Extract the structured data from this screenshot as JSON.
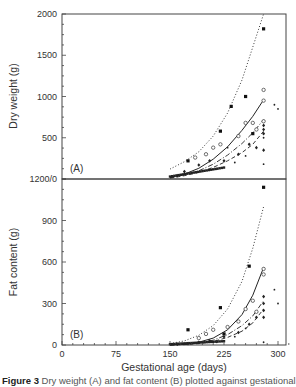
{
  "figure": {
    "caption_label": "Figure 3",
    "caption_text": "Dry weight (A) and fat content (B) plotted against gestational age"
  },
  "chart_data": [
    {
      "type": "scatter",
      "panel_label": "(A)",
      "title": "",
      "xlabel": "Gestational age (days)",
      "ylabel": "Dry weight (g)",
      "xlim": [
        0,
        320
      ],
      "ylim": [
        0,
        2000
      ],
      "xticks": [
        0,
        75,
        150,
        225,
        300
      ],
      "yticks": [
        0,
        500,
        1000,
        1500,
        2000
      ],
      "ytick_labels": [
        "1200/0",
        "500",
        "1000",
        "1500",
        "2000"
      ],
      "grid": false,
      "series": [
        {
          "name": "filled squares",
          "marker": "square-filled",
          "x": [
            175,
            220,
            235,
            255,
            265,
            280
          ],
          "y": [
            220,
            580,
            880,
            1000,
            550,
            1820
          ]
        },
        {
          "name": "open circles",
          "marker": "circle-open",
          "x": [
            185,
            200,
            210,
            220,
            245,
            255,
            265,
            270,
            280,
            280,
            280
          ],
          "y": [
            260,
            300,
            380,
            420,
            520,
            680,
            680,
            600,
            950,
            1080,
            700
          ]
        },
        {
          "name": "filled diamonds",
          "marker": "diamond-filled",
          "x": [
            160,
            170,
            190,
            205,
            225,
            245,
            260,
            270,
            280,
            280,
            280,
            280
          ],
          "y": [
            40,
            90,
            170,
            220,
            220,
            300,
            420,
            380,
            550,
            600,
            650,
            350
          ]
        },
        {
          "name": "small dots",
          "marker": "dot",
          "x": [
            215,
            230,
            240,
            255,
            280,
            280,
            295,
            300
          ],
          "y": [
            120,
            380,
            200,
            280,
            500,
            180,
            900,
            850
          ]
        }
      ],
      "fit_lines": [
        {
          "name": "dotted upper",
          "style": "dotted",
          "x": [
            150,
            170,
            190,
            210,
            230,
            250,
            265,
            280
          ],
          "y": [
            120,
            210,
            330,
            520,
            800,
            1200,
            1600,
            2000
          ]
        },
        {
          "name": "solid middle",
          "style": "solid",
          "x": [
            150,
            170,
            190,
            210,
            230,
            250,
            265,
            280
          ],
          "y": [
            20,
            60,
            130,
            240,
            390,
            590,
            760,
            960
          ]
        },
        {
          "name": "dash-dot",
          "style": "dashdot",
          "x": [
            150,
            170,
            190,
            210,
            230,
            250,
            265,
            280
          ],
          "y": [
            15,
            50,
            100,
            180,
            290,
            430,
            560,
            720
          ]
        },
        {
          "name": "dashed lower",
          "style": "dashed",
          "x": [
            150,
            170,
            190,
            210,
            230,
            250,
            265,
            280
          ],
          "y": [
            10,
            40,
            80,
            140,
            220,
            320,
            420,
            580
          ]
        }
      ]
    },
    {
      "type": "scatter",
      "panel_label": "(B)",
      "title": "",
      "xlabel": "Gestational age (days)",
      "ylabel": "Fat content (g)",
      "xlim": [
        0,
        320
      ],
      "ylim": [
        0,
        1200
      ],
      "xticks": [
        0,
        75,
        150,
        225,
        300
      ],
      "xtick_labels": [
        "0",
        "75",
        "150",
        "225",
        "300"
      ],
      "yticks": [
        0,
        300,
        600,
        900,
        1200
      ],
      "ytick_labels": [
        "0",
        "300",
        "600",
        "900",
        "1200"
      ],
      "grid": false,
      "series": [
        {
          "name": "filled squares",
          "marker": "square-filled",
          "x": [
            175,
            220,
            225,
            260,
            280
          ],
          "y": [
            110,
            270,
            80,
            570,
            1140
          ]
        },
        {
          "name": "open circles",
          "marker": "circle-open",
          "x": [
            190,
            200,
            210,
            230,
            245,
            255,
            265,
            270,
            280,
            280
          ],
          "y": [
            50,
            80,
            110,
            130,
            170,
            260,
            320,
            240,
            510,
            550
          ]
        },
        {
          "name": "filled diamonds",
          "marker": "diamond-filled",
          "x": [
            160,
            175,
            190,
            205,
            225,
            245,
            260,
            270,
            280,
            280,
            280,
            280
          ],
          "y": [
            5,
            10,
            20,
            30,
            60,
            90,
            150,
            200,
            250,
            300,
            350,
            200
          ]
        },
        {
          "name": "small dots",
          "marker": "dot",
          "x": [
            215,
            240,
            255,
            280,
            295,
            300
          ],
          "y": [
            20,
            60,
            120,
            20,
            400,
            300
          ]
        }
      ],
      "fit_lines": [
        {
          "name": "dotted upper",
          "style": "dotted",
          "x": [
            150,
            170,
            190,
            210,
            230,
            250,
            265,
            280
          ],
          "y": [
            10,
            30,
            70,
            140,
            260,
            460,
            700,
            1000
          ]
        },
        {
          "name": "solid middle",
          "style": "solid",
          "x": [
            150,
            170,
            190,
            210,
            230,
            250,
            265,
            280
          ],
          "y": [
            0,
            5,
            20,
            50,
            110,
            220,
            360,
            560
          ]
        },
        {
          "name": "dash-dot",
          "style": "dashdot",
          "x": [
            150,
            170,
            190,
            210,
            230,
            250,
            265,
            280
          ],
          "y": [
            0,
            4,
            15,
            35,
            75,
            140,
            210,
            320
          ]
        },
        {
          "name": "dashed lower",
          "style": "dashed",
          "x": [
            150,
            170,
            190,
            210,
            230,
            250,
            265,
            280
          ],
          "y": [
            0,
            3,
            10,
            25,
            55,
            100,
            160,
            260
          ]
        }
      ]
    }
  ]
}
